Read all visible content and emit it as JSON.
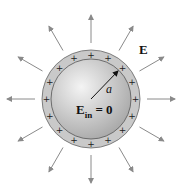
{
  "diagram": {
    "field_label": "E",
    "inside_label_main": "E",
    "inside_label_sub": "in",
    "inside_label_eq": "= 0",
    "radius_label": "a",
    "charge_symbol": "+",
    "arrow_count": 12,
    "charge_count": 16,
    "colors": {
      "ring": "#c9c9c9",
      "sphere_center": "#f2f2f2",
      "sphere_edge": "#a9a9a9",
      "arrow": "#8a8a8a",
      "outline": "#555555"
    }
  }
}
